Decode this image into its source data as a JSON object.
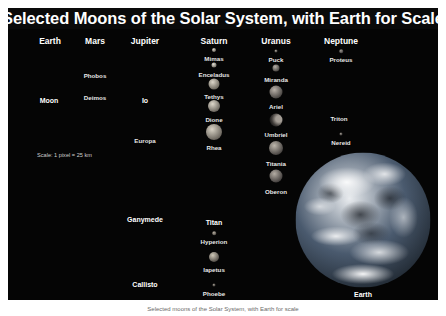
{
  "poster": {
    "title": "Selected Moons of the Solar System, with Earth for Scale",
    "scale_note": "Scale: 1 pixel = 25 km",
    "background_color": "#050505",
    "title_color": "#ffffff",
    "label_color": "#e8e8e8"
  },
  "caption": "Selected moons of the Solar System, with Earth for scale",
  "columns": [
    {
      "name": "Earth",
      "header_x": 42,
      "header_y": 28,
      "moons": [
        {
          "name": "Moon",
          "cx": 41,
          "cy": 67,
          "d": 37,
          "label_y": 89,
          "color1": "#b9b2a6",
          "color2": "#6e6961",
          "type": "full"
        }
      ]
    },
    {
      "name": "Mars",
      "header_x": 87,
      "header_y": 28,
      "moons": [
        {
          "name": "Phobos",
          "cx": 87,
          "cy": 61,
          "d": 2,
          "label_y": 64,
          "color1": "#8a8075",
          "color2": "#3a352f",
          "type": "full"
        },
        {
          "name": "Deimos",
          "cx": 87,
          "cy": 83,
          "d": 1.5,
          "label_y": 86,
          "color1": "#8a8075",
          "color2": "#3a352f",
          "type": "full"
        }
      ]
    },
    {
      "name": "Jupiter",
      "header_x": 137,
      "header_y": 28,
      "moons": [
        {
          "name": "Io",
          "cx": 137,
          "cy": 69,
          "d": 32,
          "label_y": 89,
          "color1": "#ded2ab",
          "color2": "#8a7c55",
          "type": "full"
        },
        {
          "name": "Europa",
          "cx": 137,
          "cy": 112,
          "d": 27,
          "label_y": 129,
          "color1": "#cfc2ad",
          "color2": "#756a5c",
          "type": "full"
        },
        {
          "name": "Ganymede",
          "cx": 137,
          "cy": 181,
          "d": 47,
          "label_y": 208,
          "color1": "#cbc3b4",
          "color2": "#6b655b",
          "type": "full"
        },
        {
          "name": "Callisto",
          "cx": 137,
          "cy": 247,
          "d": 43,
          "label_y": 273,
          "color1": "#a9a296",
          "color2": "#4f4a43",
          "type": "full"
        }
      ]
    },
    {
      "name": "Saturn",
      "header_x": 206,
      "header_y": 28,
      "moons": [
        {
          "name": "Mimas",
          "cx": 206,
          "cy": 42,
          "d": 4,
          "label_y": 47,
          "color1": "#d8d2c6",
          "color2": "#6e6a61",
          "type": "full"
        },
        {
          "name": "Enceladus",
          "cx": 206,
          "cy": 57,
          "d": 5,
          "label_y": 63,
          "color1": "#e4e0d6",
          "color2": "#777369",
          "type": "full"
        },
        {
          "name": "Tethys",
          "cx": 206,
          "cy": 76,
          "d": 11,
          "label_y": 85,
          "color1": "#dcd6c9",
          "color2": "#6f6a60",
          "type": "full"
        },
        {
          "name": "Dione",
          "cx": 206,
          "cy": 98,
          "d": 12,
          "label_y": 108,
          "color1": "#ded8cb",
          "color2": "#6d6860",
          "type": "full"
        },
        {
          "name": "Rhea",
          "cx": 206,
          "cy": 124,
          "d": 16,
          "label_y": 136,
          "color1": "#d9d3c6",
          "color2": "#6b665e",
          "type": "full"
        },
        {
          "name": "Titan",
          "cx": 206,
          "cy": 178,
          "d": 56,
          "label_y": 211,
          "color1": "#efe7cf",
          "color2": "#8d8468",
          "type": "full"
        },
        {
          "name": "Hyperion",
          "cx": 206,
          "cy": 225,
          "d": 3.5,
          "label_y": 230,
          "color1": "#b8b0a2",
          "color2": "#54504a",
          "type": "full"
        },
        {
          "name": "Iapetus",
          "cx": 206,
          "cy": 249,
          "d": 10,
          "label_y": 258,
          "color1": "#cfc8b8",
          "color2": "#55504a",
          "type": "full"
        },
        {
          "name": "Phoebe",
          "cx": 206,
          "cy": 277,
          "d": 3,
          "label_y": 282,
          "color1": "#9b948a",
          "color2": "#45413c",
          "type": "full"
        }
      ]
    },
    {
      "name": "Uranus",
      "header_x": 268,
      "header_y": 28,
      "moons": [
        {
          "name": "Puck",
          "cx": 268,
          "cy": 43,
          "d": 3,
          "label_y": 48,
          "color1": "#a8a198",
          "color2": "#474340",
          "type": "full"
        },
        {
          "name": "Miranda",
          "cx": 268,
          "cy": 60,
          "d": 7,
          "label_y": 68,
          "color1": "#b6afa6",
          "color2": "#4d4945",
          "type": "full"
        },
        {
          "name": "Ariel",
          "cx": 268,
          "cy": 84,
          "d": 13,
          "label_y": 95,
          "color1": "#b9b2a9",
          "color2": "#4a4643",
          "type": "full"
        },
        {
          "name": "Umbriel",
          "cx": 268,
          "cy": 112,
          "d": 13,
          "label_y": 123,
          "color1": "#a49d95",
          "color2": "#403c39",
          "type": "crescent"
        },
        {
          "name": "Titania",
          "cx": 268,
          "cy": 140,
          "d": 14,
          "label_y": 152,
          "color1": "#bdb6ac",
          "color2": "#4b4744",
          "type": "full"
        },
        {
          "name": "Oberon",
          "cx": 268,
          "cy": 168,
          "d": 13,
          "label_y": 180,
          "color1": "#b3aca3",
          "color2": "#464240",
          "type": "full"
        }
      ]
    },
    {
      "name": "Neptune",
      "header_x": 333,
      "header_y": 28,
      "moons": [
        {
          "name": "Proteus",
          "cx": 333,
          "cy": 43,
          "d": 3.5,
          "label_y": 48,
          "color1": "#9e9890",
          "color2": "#434040",
          "type": "full"
        },
        {
          "name": "Triton",
          "cx": 331,
          "cy": 86,
          "d": 27,
          "label_y": 107,
          "color1": "#d6cec1",
          "color2": "#4a4744",
          "type": "crescent"
        },
        {
          "name": "Nereid",
          "cx": 333,
          "cy": 126,
          "d": 3,
          "label_y": 131,
          "color1": "#9a948c",
          "color2": "#413e3c",
          "type": "full"
        }
      ]
    }
  ],
  "earth": {
    "name": "Earth",
    "cx": 355,
    "cy": 212,
    "d": 135,
    "label_y": 283,
    "ocean_color": "#4a5a6e",
    "cloud_color": "#e9ecef"
  },
  "scale_note_pos": {
    "x": 29,
    "y": 144
  }
}
